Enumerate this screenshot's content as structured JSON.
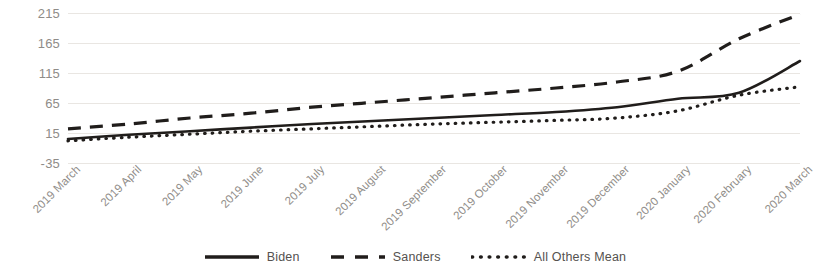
{
  "chart_data": {
    "type": "line",
    "title": "",
    "xlabel": "",
    "ylabel": "",
    "ylim": [
      -35,
      215
    ],
    "yticks": [
      215,
      165,
      115,
      65,
      15,
      -35
    ],
    "grid": true,
    "legend_position": "bottom",
    "categories": [
      "2019 March",
      "2019 April",
      "2019 May",
      "2019 June",
      "2019 July",
      "2019 August",
      "2019 September",
      "2019 October",
      "2019 November",
      "2019 December",
      "2020 January",
      "2020 February",
      "2020 March"
    ],
    "series": [
      {
        "name": "Biden",
        "style": "solid",
        "color": "#201d1b",
        "values": [
          5,
          12,
          18,
          24,
          30,
          35,
          40,
          45,
          50,
          58,
          72,
          82,
          135
        ]
      },
      {
        "name": "Sanders",
        "style": "dashed",
        "color": "#201d1b",
        "values": [
          22,
          30,
          40,
          48,
          58,
          66,
          74,
          82,
          90,
          100,
          118,
          172,
          213
        ]
      },
      {
        "name": "All Others Mean",
        "style": "dotted",
        "color": "#201d1b",
        "values": [
          2,
          8,
          13,
          18,
          22,
          26,
          30,
          33,
          36,
          40,
          52,
          78,
          92
        ]
      }
    ]
  },
  "legend": {
    "items": [
      {
        "label": "Biden",
        "style": "solid",
        "icon": "solid-line-swatch"
      },
      {
        "label": "Sanders",
        "style": "dashed",
        "icon": "dashed-line-swatch"
      },
      {
        "label": "All Others Mean",
        "style": "dotted",
        "icon": "dotted-line-swatch"
      }
    ]
  },
  "axis_colors": {
    "gridline": "#e9e6e2",
    "tick_label": "#8f8c88",
    "series": "#201d1b"
  }
}
